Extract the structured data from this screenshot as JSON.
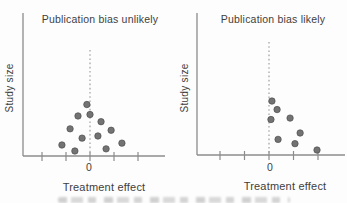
{
  "chart_data": [
    {
      "type": "scatter",
      "title": "Publication bias unlikely",
      "xlabel": "Treatment effect",
      "ylabel": "Study size",
      "x_axis": {
        "zero_label": "0",
        "ticks_in_units": [
          -2,
          -1,
          0,
          1,
          2
        ],
        "units_note": "x expressed in tick-spacing units; 0 is the dashed no-effect reference line"
      },
      "y_axis": {
        "tick_labels": [],
        "units_note": "study size increases upward; y given as fraction of axis height"
      },
      "reference_line": {
        "x": 0,
        "style": "dashed"
      },
      "points": [
        {
          "x": -0.13,
          "y": 0.36
        },
        {
          "x": -0.5,
          "y": 0.28
        },
        {
          "x": 0.0,
          "y": 0.29
        },
        {
          "x": 0.46,
          "y": 0.24
        },
        {
          "x": -0.83,
          "y": 0.19
        },
        {
          "x": 0.88,
          "y": 0.18
        },
        {
          "x": 0.33,
          "y": 0.14
        },
        {
          "x": -0.33,
          "y": 0.125
        },
        {
          "x": 1.33,
          "y": 0.09
        },
        {
          "x": -1.17,
          "y": 0.077
        },
        {
          "x": 0.67,
          "y": 0.05
        },
        {
          "x": -0.63,
          "y": 0.035
        }
      ],
      "layout_px": {
        "y_axis_x": 23,
        "y_axis_top": 13,
        "x_axis_y": 156,
        "x_axis_end": 165,
        "zero_x": 90,
        "tick_spacing": 24,
        "dashed_top_y": 50,
        "dot_radius": 3.2
      }
    },
    {
      "type": "scatter",
      "title": "Publication bias likely",
      "xlabel": "Treatment effect",
      "ylabel": "Study size",
      "x_axis": {
        "zero_label": "0",
        "ticks_in_units": [
          -2,
          -1,
          0,
          1,
          2
        ],
        "units_note": "x expressed in tick-spacing units; 0 is the dashed no-effect reference line"
      },
      "y_axis": {
        "tick_labels": [],
        "units_note": "study size increases upward; y given as fraction of axis height"
      },
      "reference_line": {
        "x": 0,
        "style": "dashed"
      },
      "points": [
        {
          "x": 0.12,
          "y": 0.38
        },
        {
          "x": 0.33,
          "y": 0.32
        },
        {
          "x": 0.08,
          "y": 0.25
        },
        {
          "x": 0.86,
          "y": 0.26
        },
        {
          "x": 1.27,
          "y": 0.155
        },
        {
          "x": 0.37,
          "y": 0.11
        },
        {
          "x": 1.06,
          "y": 0.08
        },
        {
          "x": 1.96,
          "y": 0.035
        }
      ],
      "layout_px": {
        "y_axis_x": 197,
        "y_axis_top": 13,
        "x_axis_y": 155,
        "x_axis_end": 345,
        "zero_x": 269,
        "tick_spacing": 24.5,
        "dashed_top_y": 42,
        "dot_radius": 3.2
      }
    }
  ],
  "colors": {
    "background": "#fdfdfd",
    "axis": "#8c8c8c",
    "dashed_line": "#969696",
    "dot_fill": "#737373",
    "dot_stroke": "#4e4e4e",
    "text": "#3e3e3e"
  },
  "cropped_caption": {
    "visible": true
  }
}
